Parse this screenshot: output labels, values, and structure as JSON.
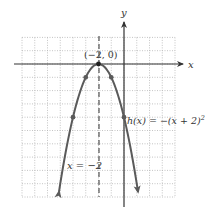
{
  "chart_data": {
    "type": "line",
    "title": "",
    "function_label": "h(x) = −(x + 2)²",
    "xlabel": "x",
    "ylabel": "y",
    "xlim": [
      -8,
      4
    ],
    "ylim": [
      -10,
      2
    ],
    "grid": true,
    "grid_style": "dotted",
    "series": [
      {
        "name": "h(x) = −(x + 2)²",
        "type": "parabola",
        "x": [
          -5.1,
          -4,
          -3,
          -2,
          -1,
          0,
          1.1
        ],
        "y": [
          -9.6,
          -4,
          -1,
          0,
          -1,
          -4,
          -9.6
        ],
        "marked_points": [
          {
            "x": -4,
            "y": -4
          },
          {
            "x": -3,
            "y": -1
          },
          {
            "x": -2,
            "y": 0
          },
          {
            "x": -1,
            "y": -1
          },
          {
            "x": 0,
            "y": -4
          }
        ],
        "arrows_at_ends": true
      }
    ],
    "annotations": [
      {
        "text": "(−2, 0)",
        "x": -2,
        "y": 0,
        "kind": "vertex-label"
      },
      {
        "text": "x = −2",
        "x": -2,
        "y": -7.5,
        "kind": "axis-of-symmetry-label"
      },
      {
        "text": "h(x) = −(x + 2)²",
        "x": 0.2,
        "y": -4,
        "kind": "function-label"
      }
    ],
    "axis_of_symmetry": {
      "x": -2,
      "style": "dashed"
    }
  },
  "labels": {
    "x_axis": "x",
    "y_axis": "y",
    "vertex": "(−2, 0)",
    "symmetry": "x = −2",
    "function_prefix": "h(x) = −(x + 2)",
    "function_exp": "2"
  },
  "colors": {
    "curve": "#5a5a5a",
    "axis": "#333333",
    "grid": "#b5b5b5",
    "dashed": "#333333"
  }
}
